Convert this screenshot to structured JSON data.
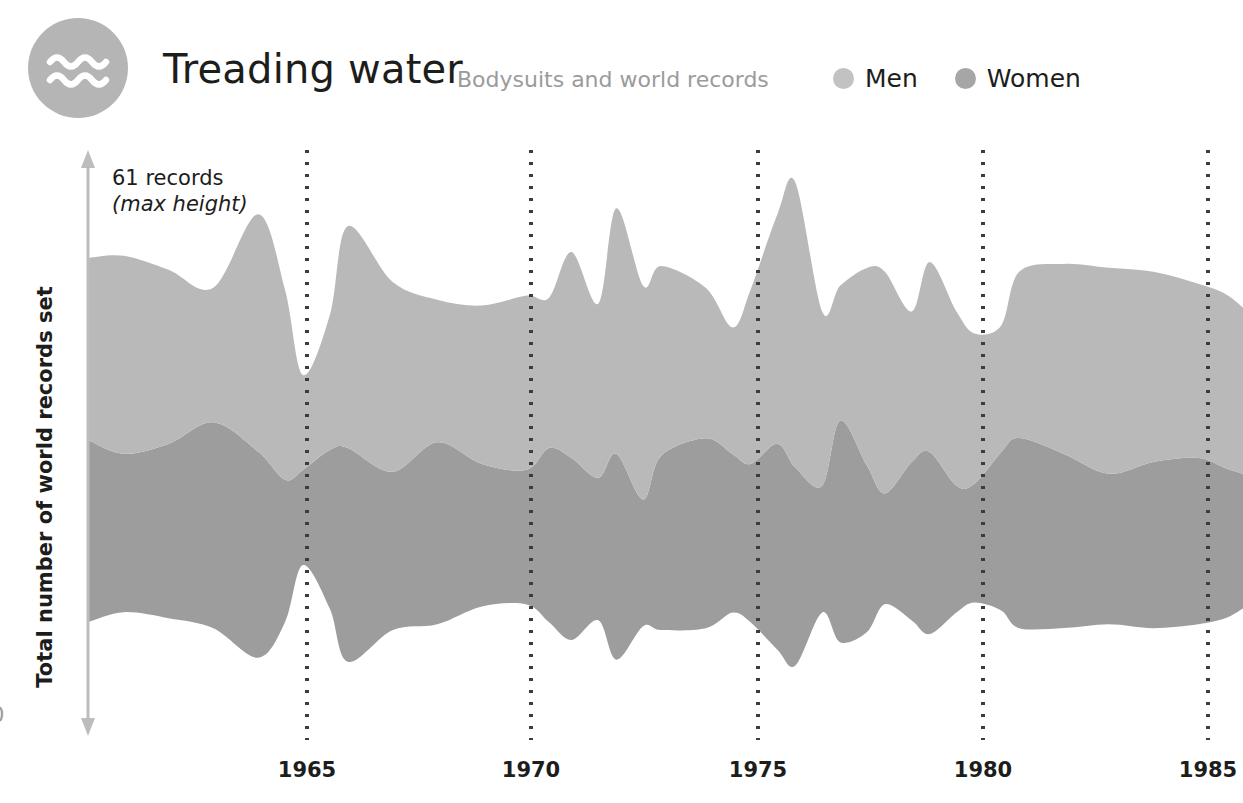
{
  "header": {
    "logo_icon": "water-waves-icon",
    "title": "Treading water",
    "subtitle": "Bodysuits and world records",
    "legend": [
      {
        "label": "Men",
        "color": "#c2c2c2",
        "icon": "legend-dot-icon"
      },
      {
        "label": "Women",
        "color": "#a6a6a6",
        "icon": "legend-dot-icon"
      }
    ]
  },
  "axes": {
    "y_label": "Total number of world records set",
    "y_zero_label": "0",
    "annotation_line1": "61 records",
    "annotation_line2": "(max height)",
    "x_ticks": [
      "1965",
      "1970",
      "1975",
      "1980",
      "1985"
    ],
    "x_tick_positions": [
      307,
      531,
      758,
      983,
      1208
    ],
    "x_axis_arrow": "axis-arrow-icon"
  },
  "colors": {
    "men": "#b9b9b9",
    "women": "#9d9d9d",
    "overlap": "#a8a8a8",
    "gridline": "#3c3c3b",
    "axis_arrow": "#bdbdbd",
    "subtitle": "#9b9b9b",
    "logo_bg": "#b5b5b5",
    "text": "#1d1d1b"
  },
  "chart_data": {
    "type": "area",
    "variant": "streamgraph",
    "title": "Treading water",
    "subtitle": "Bodysuits and world records",
    "xlabel": "",
    "ylabel": "Total number of world records set",
    "max_total_records": 61,
    "max_total_label": "61 records (max height)",
    "grid": "vertical dotted lines at each labelled year",
    "legend_position": "top-right",
    "xlim": [
      1960.2,
      1986.0
    ],
    "x_tick_values": [
      1965,
      1970,
      1975,
      1980,
      1985
    ],
    "categories": [
      1960.2,
      1961,
      1962,
      1963,
      1964,
      1964.6,
      1965,
      1965.6,
      1966,
      1967,
      1968,
      1969,
      1970,
      1970.5,
      1971,
      1971.6,
      1972,
      1972.6,
      1973,
      1974,
      1974.6,
      1975,
      1975.6,
      1976,
      1976.6,
      1977,
      1977.6,
      1978,
      1978.6,
      1979,
      1979.6,
      1980,
      1980.6,
      1981,
      1982,
      1983,
      1984,
      1985,
      1985.6,
      1986
    ],
    "series": [
      {
        "name": "Men",
        "color": "#b9b9b9",
        "values": [
          23,
          25,
          22,
          17,
          30,
          24,
          12,
          17,
          28,
          24,
          18,
          20,
          22,
          19,
          26,
          22,
          31,
          27,
          24,
          19,
          16,
          22,
          29,
          36,
          22,
          17,
          25,
          28,
          19,
          24,
          22,
          19,
          16,
          21,
          24,
          26,
          24,
          22,
          22,
          21
        ]
      },
      {
        "name": "Women",
        "color": "#9d9d9d",
        "values": [
          23,
          20,
          22,
          26,
          26,
          18,
          12,
          20,
          27,
          20,
          23,
          18,
          17,
          22,
          23,
          18,
          26,
          16,
          22,
          24,
          20,
          20,
          26,
          25,
          16,
          28,
          21,
          14,
          20,
          23,
          16,
          15,
          20,
          24,
          22,
          19,
          21,
          21,
          19,
          17
        ]
      }
    ]
  }
}
